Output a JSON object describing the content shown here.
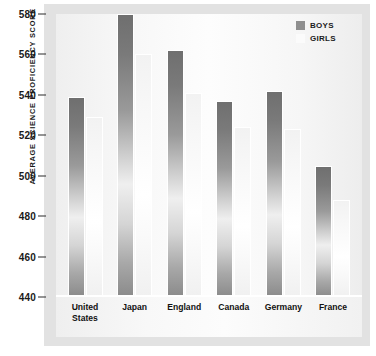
{
  "chart_data": {
    "type": "bar",
    "title": "",
    "subtitle": "",
    "xlabel": "",
    "ylabel": "AVERAGE SCIENCE PROFICIENCY SCORE",
    "categories": [
      "United\nStates",
      "Japan",
      "England",
      "Canada",
      "Germany",
      "France"
    ],
    "series": [
      {
        "name": "BOYS",
        "color": "#8f8f8f",
        "values": [
          539,
          580,
          562,
          537,
          542,
          505
        ]
      },
      {
        "name": "GIRLS",
        "color": "#fbfbfb",
        "values": [
          529,
          560,
          541,
          524,
          523,
          488
        ]
      }
    ],
    "ylim": [
      440,
      580
    ],
    "yticks": [
      580,
      560,
      540,
      520,
      500,
      480,
      460,
      440
    ],
    "ytick_labels": [
      "580",
      "560",
      "540",
      "520",
      "500",
      "480",
      "460",
      "440"
    ],
    "grid": false,
    "legend_position": "top-right",
    "legend": [
      "BOYS",
      "GIRLS"
    ]
  },
  "colors": {
    "figure_background": "#e2e2e2",
    "plot_background": "#fbfbfb",
    "boys_bar": "#8f8f8f",
    "girls_bar": "#fbfbfb",
    "text": "#1a1a1a",
    "tick_mark": "#2b2b2b",
    "bar_outline": "#ffffff"
  }
}
